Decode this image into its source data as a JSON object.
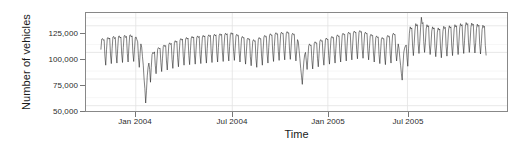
{
  "chart_data": {
    "type": "line",
    "title": "",
    "xlabel": "Time",
    "ylabel": "Number of vehicles",
    "grid": true,
    "legend": null,
    "ylim": [
      45000,
      137000
    ],
    "xlim": [
      "2003-11-01",
      "2005-10-15"
    ],
    "y_ticks": [
      {
        "value": 50000,
        "label": "50,000"
      },
      {
        "value": 75000,
        "label": "75,000"
      },
      {
        "value": 100000,
        "label": "100,000"
      },
      {
        "value": 125000,
        "label": "125,000"
      }
    ],
    "x_ticks": [
      {
        "value": "2004-01-01",
        "label": "Jan 2004"
      },
      {
        "value": "2004-07-01",
        "label": "Jul 2004"
      },
      {
        "value": "2005-01-01",
        "label": "Jan 2005"
      },
      {
        "value": "2005-07-01",
        "label": "Jul 2005"
      }
    ],
    "line_color": "#1a1a1a",
    "panel_border_color": "#888888",
    "grid_color": "#e6e6e6",
    "series": [
      {
        "name": "Number of vehicles",
        "description": "Daily vehicle counts with strong weekly seasonality (weekday peaks, weekend troughs) and deep holiday troughs at each New Year period.",
        "values": [
          103000,
          112500,
          113000,
          111500,
          112000,
          96500,
          88000,
          102500,
          113500,
          114000,
          112500,
          113500,
          97500,
          89500,
          103500,
          114500,
          115000,
          113000,
          114000,
          98000,
          90000,
          104000,
          115000,
          115500,
          113500,
          114500,
          98500,
          90500,
          104500,
          115500,
          116000,
          114000,
          115000,
          99000,
          91000,
          105000,
          116000,
          116500,
          114500,
          115500,
          99500,
          91500,
          103000,
          114000,
          114500,
          112000,
          110000,
          95000,
          86000,
          99000,
          108000,
          105000,
          96000,
          88000,
          75000,
          66000,
          52500,
          64000,
          78000,
          86000,
          90000,
          84000,
          72000,
          86000,
          98000,
          100000,
          99000,
          100500,
          88000,
          80000,
          92000,
          103000,
          104500,
          103500,
          104000,
          90500,
          82000,
          94000,
          105500,
          107000,
          105500,
          106500,
          92000,
          83500,
          96000,
          107500,
          109000,
          107500,
          108500,
          93500,
          85000,
          98000,
          109500,
          111000,
          109500,
          110500,
          95000,
          86500,
          100000,
          111500,
          113000,
          111500,
          112500,
          96500,
          88000,
          101000,
          112500,
          114000,
          112500,
          113500,
          97000,
          88500,
          102000,
          113500,
          115000,
          113500,
          114500,
          97500,
          89000,
          102500,
          114000,
          115500,
          114000,
          115000,
          98000,
          89500,
          103000,
          114500,
          116000,
          114500,
          115500,
          98500,
          90000,
          103500,
          115000,
          116500,
          115000,
          116000,
          99000,
          90500,
          104000,
          115500,
          117000,
          115500,
          116500,
          99500,
          91000,
          104500,
          116000,
          117500,
          116000,
          117000,
          100000,
          91500,
          105000,
          116500,
          118000,
          116500,
          117500,
          100500,
          92000,
          105500,
          117000,
          118500,
          117000,
          118000,
          101000,
          92500,
          104000,
          115500,
          117000,
          115500,
          116000,
          99500,
          91000,
          102000,
          113500,
          115000,
          113500,
          114000,
          97500,
          89000,
          100500,
          112000,
          113500,
          112000,
          112500,
          96000,
          87500,
          99000,
          110500,
          112000,
          110500,
          111000,
          94500,
          86000,
          101000,
          112500,
          114000,
          112500,
          113000,
          96500,
          88000,
          103000,
          114500,
          116000,
          114500,
          115000,
          98500,
          90000,
          104500,
          116000,
          117500,
          116000,
          116500,
          100000,
          91500,
          105500,
          117000,
          118500,
          117000,
          117500,
          101000,
          92500,
          106000,
          117500,
          119000,
          117500,
          118000,
          101500,
          93000,
          106500,
          118000,
          119500,
          118000,
          118500,
          102000,
          93500,
          105000,
          116500,
          118000,
          116500,
          117000,
          100500,
          92000,
          102000,
          112000,
          110000,
          102000,
          94000,
          85000,
          78000,
          70000,
          82000,
          92000,
          98000,
          100000,
          92000,
          84000,
          95000,
          106000,
          108000,
          106500,
          107000,
          92500,
          84500,
          97000,
          108500,
          110000,
          108500,
          109000,
          94500,
          86500,
          99000,
          110500,
          112000,
          110500,
          111000,
          96000,
          88000,
          100500,
          112000,
          113500,
          112000,
          112500,
          97000,
          89000,
          102000,
          113500,
          115000,
          113500,
          114000,
          98000,
          90000,
          103500,
          115000,
          116500,
          115000,
          115500,
          99500,
          91000,
          105000,
          116500,
          118000,
          116500,
          117000,
          100500,
          92000,
          106000,
          117500,
          119000,
          117500,
          118000,
          101500,
          93000,
          107000,
          118500,
          120000,
          118500,
          119000,
          102500,
          94000,
          107500,
          119000,
          120500,
          119000,
          119500,
          103000,
          94500,
          106000,
          117500,
          119000,
          117500,
          118000,
          101500,
          93000,
          104000,
          115500,
          117000,
          115500,
          116000,
          99500,
          91000,
          102500,
          114000,
          115500,
          114000,
          114500,
          98000,
          89500,
          101000,
          112500,
          114000,
          112500,
          113000,
          96500,
          88500,
          103000,
          114500,
          116000,
          114500,
          115000,
          98500,
          90000,
          105000,
          116500,
          118000,
          116500,
          117000,
          100500,
          92000,
          100000,
          108000,
          104000,
          95000,
          88000,
          80000,
          74000,
          88000,
          100000,
          104000,
          106000,
          107000,
          95000,
          87000,
          104000,
          118000,
          124000,
          122000,
          123000,
          106000,
          97000,
          108000,
          121000,
          127000,
          125000,
          126000,
          108000,
          99000,
          110000,
          123000,
          133000,
          127000,
          128000,
          110000,
          100000,
          109000,
          122000,
          126000,
          124000,
          125000,
          107000,
          98000,
          107000,
          120000,
          124000,
          122000,
          123000,
          105000,
          96000,
          106000,
          119000,
          123000,
          121000,
          122000,
          104000,
          95000,
          107000,
          120000,
          124500,
          122500,
          123500,
          105500,
          96500,
          108000,
          121000,
          125000,
          123000,
          124000,
          106000,
          97000,
          109000,
          122000,
          126000,
          124000,
          125000,
          107000,
          98000,
          110000,
          123000,
          127000,
          125000,
          126000,
          108000,
          99000,
          111000,
          124000,
          128000,
          126000,
          127000,
          109000,
          100000,
          110500,
          123500,
          127500,
          125500,
          126500,
          108500,
          99500,
          109500,
          122500,
          126500,
          124500,
          125500,
          107500,
          98500,
          108500,
          121500,
          125500,
          123500,
          124500,
          106500,
          97500
        ]
      }
    ]
  },
  "axis": {
    "y_title": "Number of vehicles",
    "x_title": "Time",
    "y_tick_labels": [
      "125,000",
      "100,000",
      "75,000",
      "50,000"
    ],
    "x_tick_labels": [
      "Jan 2004",
      "Jul 2004",
      "Jan 2005",
      "Jul 2005"
    ]
  }
}
